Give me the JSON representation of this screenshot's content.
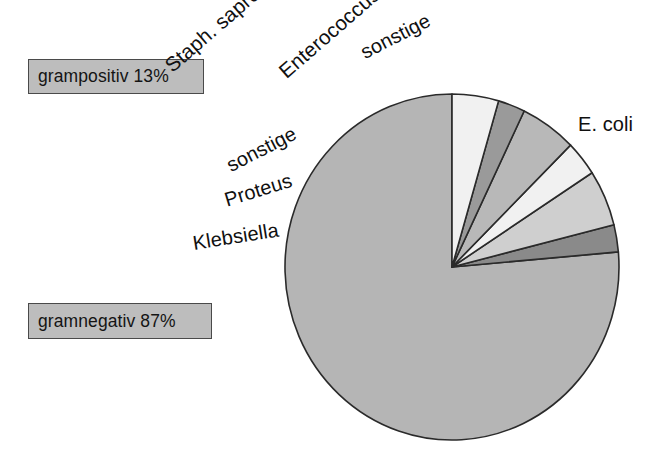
{
  "figure": {
    "title": "",
    "background": "#ffffff"
  },
  "annotations": {
    "gram_positive": {
      "text": "grampositiv 13%",
      "value": 13,
      "box_fill": "#bdbdbd",
      "box_stroke": "#4a4a4a"
    },
    "gram_negative": {
      "text": "gramnegativ 87%",
      "value": 87,
      "box_fill": "#bdbdbd",
      "box_stroke": "#4a4a4a"
    }
  },
  "labels": {
    "staph": "Staph. saprophyticus",
    "enterococcus": "Enterococcus",
    "sonstige_top": "sonstige",
    "sonstige_left": "sonstige",
    "proteus": "Proteus",
    "klebsiella": "Klebsiella",
    "ecoli": "E. coli"
  },
  "chart_data": {
    "type": "pie",
    "title": "",
    "xlabel": "",
    "ylabel": "",
    "legend_position": "none",
    "grid": false,
    "start_angle_deg": 0,
    "direction": "counterclockwise",
    "center": {
      "x": 452,
      "y": 267
    },
    "radius": {
      "rx": 167,
      "ry": 173
    },
    "stroke": "#2a2a2a",
    "stroke_width": 1.6,
    "categories": [
      "E. coli",
      "Klebsiella",
      "Proteus",
      "sonstige",
      "Staph. saprophyticus",
      "Enterococcus",
      "sonstige"
    ],
    "values": [
      76.4,
      2.5,
      5.3,
      3.3,
      5.4,
      2.6,
      4.5
    ],
    "angles_deg": [
      275.0,
      9.1,
      18.9,
      11.8,
      19.6,
      9.4,
      16.2
    ],
    "colors": [
      "#b5b5b5",
      "#8a8a8a",
      "#cfcfcf",
      "#f1f1f1",
      "#b8b8b8",
      "#9a9a9a",
      "#f1f1f1"
    ],
    "groups": [
      {
        "name": "gramnegativ",
        "percent": 87,
        "members": [
          "E. coli",
          "Klebsiella",
          "Proteus",
          "sonstige"
        ]
      },
      {
        "name": "grampositiv",
        "percent": 13,
        "members": [
          "Staph. saprophyticus",
          "Enterococcus",
          "sonstige"
        ]
      }
    ]
  }
}
